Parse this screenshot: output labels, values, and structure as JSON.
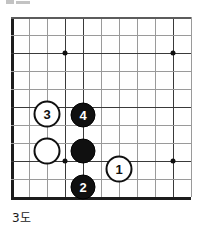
{
  "figure": {
    "caption": "3도",
    "kind": "go-board-diagram",
    "top_partial_text": ""
  },
  "board": {
    "origin_x": 11,
    "origin_y": 17,
    "spacing": 18,
    "columns": 11,
    "rows": 11,
    "line_color": "#9a9a9a",
    "dark_line_color": "#3a3a3a",
    "edge_color": "#1c1c1c",
    "star_color": "#111111",
    "star_points": [
      {
        "col": 3,
        "row": 2
      },
      {
        "col": 3,
        "row": 8
      },
      {
        "col": 9,
        "row": 2
      },
      {
        "col": 9,
        "row": 8
      }
    ],
    "dark_vertical_columns": [
      0,
      3,
      4,
      9
    ],
    "dark_horizontal_rows": [
      2,
      5,
      8,
      10
    ]
  },
  "stones": [
    {
      "label": "3",
      "color": "white",
      "col": 2,
      "row": 5.4,
      "name": "stone-white-3"
    },
    {
      "label": "4",
      "color": "black",
      "col": 4,
      "row": 5.45,
      "name": "stone-black-4"
    },
    {
      "label": "",
      "color": "white",
      "col": 2,
      "row": 7.45,
      "name": "stone-white-plain"
    },
    {
      "label": "",
      "color": "black",
      "col": 4,
      "row": 7.45,
      "name": "stone-black-plain"
    },
    {
      "label": "1",
      "color": "white",
      "col": 6,
      "row": 8.45,
      "name": "stone-white-1"
    },
    {
      "label": "2",
      "color": "black",
      "col": 4,
      "row": 9.45,
      "name": "stone-black-2"
    }
  ],
  "colors": {
    "black_stone": "#101010",
    "white_stone": "#ffffff",
    "background": "#ffffff",
    "text": "#1a1a1a"
  }
}
